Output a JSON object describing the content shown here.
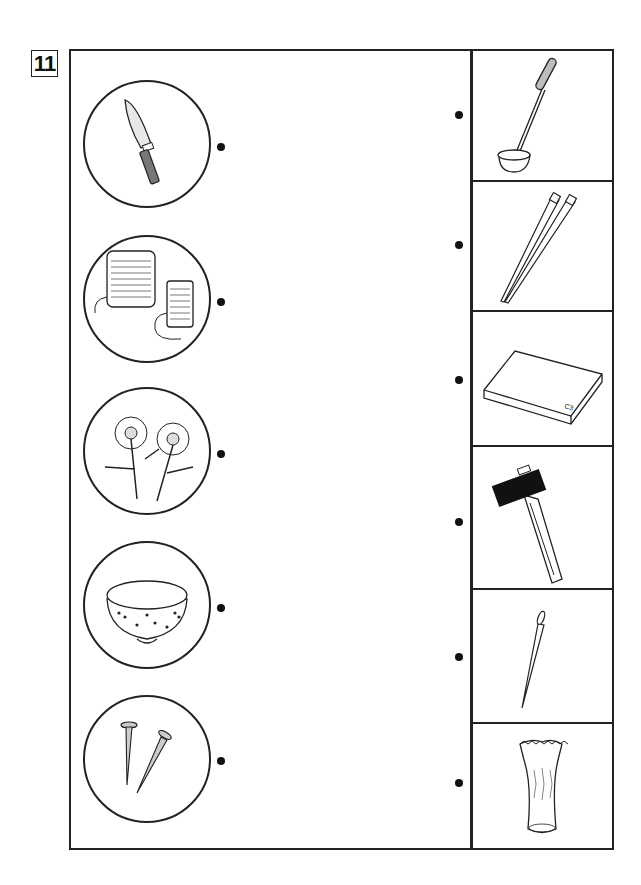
{
  "worksheet": {
    "question_number": "11",
    "type": "matching exercise: connect left pictures to right pictures with lines"
  },
  "left_items": [
    {
      "name": "kitchen-knife",
      "label": "knife (hōchō)"
    },
    {
      "name": "thread-spools",
      "label": "thread spools"
    },
    {
      "name": "daisies",
      "label": "flowers"
    },
    {
      "name": "rice-bowl",
      "label": "rice bowl"
    },
    {
      "name": "nails",
      "label": "nails"
    }
  ],
  "right_items": [
    {
      "name": "ladle",
      "label": "ladle"
    },
    {
      "name": "chopsticks",
      "label": "chopsticks"
    },
    {
      "name": "cutting-board",
      "label": "cutting board"
    },
    {
      "name": "hammer",
      "label": "hammer"
    },
    {
      "name": "sewing-needle",
      "label": "needle"
    },
    {
      "name": "vase",
      "label": "vase"
    }
  ],
  "colors": {
    "line": "#222222",
    "gray_fill": "#bdbdbd",
    "black_fill": "#111111"
  }
}
